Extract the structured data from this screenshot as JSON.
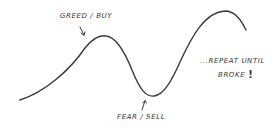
{
  "diagram": {
    "type": "hand-drawn market cycle sketch",
    "colors": {
      "stroke": "#3a3a3a",
      "text": "#333333",
      "background": "#ffffff"
    },
    "labels": {
      "peak": "GREED / BUY",
      "trough": "FEAR / SELL",
      "repeat_line1": "...REPEAT UNTIL",
      "repeat_line2": "BROKE",
      "repeat_bang": "!"
    },
    "curve_points": [
      {
        "x": 20,
        "y": 100,
        "role": "start"
      },
      {
        "x": 105,
        "y": 36,
        "role": "first-peak"
      },
      {
        "x": 150,
        "y": 95,
        "role": "trough"
      },
      {
        "x": 227,
        "y": 12,
        "role": "second-peak"
      },
      {
        "x": 246,
        "y": 30,
        "role": "end"
      }
    ]
  }
}
